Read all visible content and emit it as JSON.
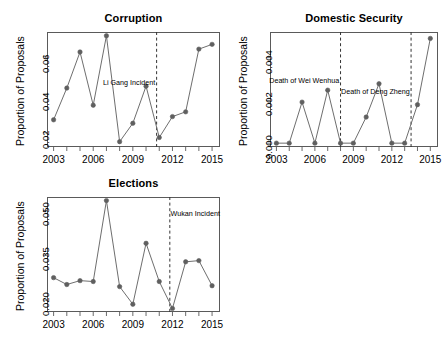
{
  "figure": {
    "background": "#ffffff",
    "line_color": "#6e6e6e",
    "point_color": "#5f5f5f",
    "axis_color": "#5a5a5a",
    "width": 444,
    "height": 338
  },
  "chart_data": [
    {
      "type": "line",
      "title": "Corruption",
      "xlabel": "",
      "ylabel": "Proportion of Proposals",
      "x": [
        2003,
        2004,
        2005,
        2006,
        2007,
        2008,
        2009,
        2010,
        2011,
        2012,
        2013,
        2014,
        2015
      ],
      "values": [
        0.0268,
        0.0435,
        0.0625,
        0.0345,
        0.071,
        0.0153,
        0.025,
        0.0445,
        0.0175,
        0.0285,
        0.031,
        0.064,
        0.0665
      ],
      "xlim": [
        2002.5,
        2015.6
      ],
      "ylim": [
        0.0125,
        0.073
      ],
      "xticks": [
        2003,
        2006,
        2009,
        2012,
        2015
      ],
      "xminorticks": [
        2003,
        2004,
        2005,
        2006,
        2007,
        2008,
        2009,
        2010,
        2011,
        2012,
        2013,
        2014,
        2015
      ],
      "yticks": [
        0.02,
        0.04,
        0.06
      ],
      "ytick_labels": [
        "0.02",
        "0.04",
        "0.06"
      ],
      "grid": false,
      "legend": "none",
      "vlines": [
        {
          "x": 2010.8,
          "style": "dashed"
        }
      ],
      "annotations": [
        {
          "text": "Li Gang Incident",
          "x": 2010.7,
          "y": 0.047,
          "anchor": "end"
        }
      ]
    },
    {
      "type": "line",
      "title": "Domestic Security",
      "xlabel": "",
      "ylabel": "Proportion of Proposals",
      "x": [
        2003,
        2004,
        2005,
        2006,
        2007,
        2008,
        2009,
        2010,
        2011,
        2012,
        2013,
        2014,
        2015
      ],
      "values": [
        0.0,
        0.0,
        0.00192,
        0.0,
        0.00248,
        0.0,
        0.0,
        0.00122,
        0.00278,
        0.0,
        0.0,
        0.0018,
        0.0049
      ],
      "xlim": [
        2002.5,
        2015.6
      ],
      "ylim": [
        -0.00018,
        0.0052
      ],
      "xticks": [
        2003,
        2006,
        2009,
        2012,
        2015
      ],
      "xminorticks": [
        2003,
        2004,
        2005,
        2006,
        2007,
        2008,
        2009,
        2010,
        2011,
        2012,
        2013,
        2014,
        2015
      ],
      "yticks": [
        0.0,
        0.002,
        0.004
      ],
      "ytick_labels": [
        "0.000",
        "0.002",
        "0.004"
      ],
      "grid": false,
      "legend": "none",
      "vlines": [
        {
          "x": 2008.0,
          "style": "dashed"
        },
        {
          "x": 2013.5,
          "style": "dashed"
        }
      ],
      "annotations": [
        {
          "text": "Death of Wei Wenhua",
          "x": 2007.9,
          "y": 0.003,
          "anchor": "end"
        },
        {
          "text": "Death of Deng Zheng",
          "x": 2013.4,
          "y": 0.00248,
          "anchor": "end"
        }
      ]
    },
    {
      "type": "line",
      "title": "Elections",
      "xlabel": "",
      "ylabel": "Proportion of Proposals",
      "x": [
        2003,
        2004,
        2005,
        2006,
        2007,
        2008,
        2009,
        2010,
        2011,
        2012,
        2013,
        2014,
        2015
      ],
      "values": [
        0.0275,
        0.0252,
        0.0265,
        0.0262,
        0.0533,
        0.0245,
        0.0186,
        0.039,
        0.0262,
        0.0172,
        0.0328,
        0.0332,
        0.0248
      ],
      "xlim": [
        2002.5,
        2015.6
      ],
      "ylim": [
        0.016,
        0.0545
      ],
      "xticks": [
        2003,
        2006,
        2009,
        2012,
        2015
      ],
      "xminorticks": [
        2003,
        2004,
        2005,
        2006,
        2007,
        2008,
        2009,
        2010,
        2011,
        2012,
        2013,
        2014,
        2015
      ],
      "yticks": [
        0.02,
        0.035,
        0.05
      ],
      "ytick_labels": [
        "0.020",
        "0.035",
        "0.050"
      ],
      "grid": false,
      "legend": "none",
      "vlines": [
        {
          "x": 2011.8,
          "style": "dashed"
        }
      ],
      "annotations": [
        {
          "text": "Wukan Incident",
          "x": 2011.7,
          "y": 0.0495,
          "anchor": "start"
        }
      ]
    }
  ]
}
